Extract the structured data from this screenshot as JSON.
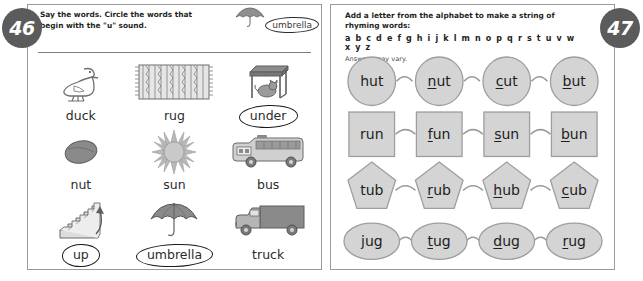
{
  "spread": {
    "left_page_number": "46",
    "right_page_number": "47",
    "shape_fill": "#d4d4d4",
    "shape_stroke": "#8c8c8c",
    "badge_color": "#5b5b5b"
  },
  "left": {
    "instruction": "Say the words. Circle the words that begin with the \"u\" sound.",
    "example": {
      "label": "umbrella",
      "icon": "umbrella-icon",
      "circled": true
    },
    "items": [
      {
        "word": "duck",
        "icon": "duck-icon",
        "circled": false
      },
      {
        "word": "rug",
        "icon": "rug-icon",
        "circled": false
      },
      {
        "word": "under",
        "icon": "table-cat-icon",
        "circled": true
      },
      {
        "word": "nut",
        "icon": "nut-icon",
        "circled": false
      },
      {
        "word": "sun",
        "icon": "sun-icon",
        "circled": false
      },
      {
        "word": "bus",
        "icon": "bus-icon",
        "circled": false
      },
      {
        "word": "up",
        "icon": "stairs-icon",
        "circled": true
      },
      {
        "word": "umbrella",
        "icon": "umbrella-icon",
        "circled": true
      },
      {
        "word": "truck",
        "icon": "truck-icon",
        "circled": false
      }
    ]
  },
  "right": {
    "instruction": "Add a letter from the alphabet to make a string of rhyming words:",
    "alphabet": "a b c d e f g h i j k l m n o p q r s t u v w x y z",
    "note": "Answers may vary.",
    "rows": [
      {
        "shape": "circle",
        "words": [
          {
            "text": "hut",
            "added_letter": "",
            "rest": "hut"
          },
          {
            "text": "nut",
            "added_letter": "n",
            "rest": "ut"
          },
          {
            "text": "cut",
            "added_letter": "c",
            "rest": "ut"
          },
          {
            "text": "but",
            "added_letter": "b",
            "rest": "ut"
          }
        ]
      },
      {
        "shape": "square",
        "words": [
          {
            "text": "run",
            "added_letter": "",
            "rest": "run"
          },
          {
            "text": "fun",
            "added_letter": "f",
            "rest": "un"
          },
          {
            "text": "sun",
            "added_letter": "s",
            "rest": "un"
          },
          {
            "text": "bun",
            "added_letter": "b",
            "rest": "un"
          }
        ]
      },
      {
        "shape": "pentagon",
        "words": [
          {
            "text": "tub",
            "added_letter": "",
            "rest": "tub"
          },
          {
            "text": "rub",
            "added_letter": "r",
            "rest": "ub"
          },
          {
            "text": "hub",
            "added_letter": "h",
            "rest": "ub"
          },
          {
            "text": "cub",
            "added_letter": "c",
            "rest": "ub"
          }
        ]
      },
      {
        "shape": "ellipse",
        "words": [
          {
            "text": "jug",
            "added_letter": "",
            "rest": "jug"
          },
          {
            "text": "tug",
            "added_letter": "t",
            "rest": "ug"
          },
          {
            "text": "dug",
            "added_letter": "d",
            "rest": "ug"
          },
          {
            "text": "rug",
            "added_letter": "r",
            "rest": "ug"
          }
        ]
      }
    ]
  }
}
